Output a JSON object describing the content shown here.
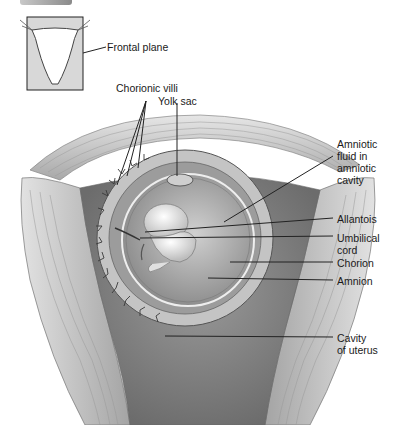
{
  "figure": {
    "type": "anatomical-illustration",
    "inset": {
      "label": "Frontal plane"
    },
    "labels": [
      {
        "id": "chorionic-villi",
        "text": "Chorionic villi"
      },
      {
        "id": "yolk-sac",
        "text": "Yolk sac"
      },
      {
        "id": "amniotic-fluid",
        "text": "Amniotic\nfluid in\namniotic\ncavity"
      },
      {
        "id": "allantois",
        "text": "Allantois"
      },
      {
        "id": "umbilical-cord",
        "text": "Umbilical\ncord"
      },
      {
        "id": "chorion",
        "text": "Chorion"
      },
      {
        "id": "amnion",
        "text": "Amnion"
      },
      {
        "id": "cavity-of-uterus",
        "text": "Cavity\nof uterus"
      }
    ]
  },
  "colors": {
    "background": "#ffffff",
    "label_text": "#1a1a1a",
    "leader_line": "#222222",
    "tissue_light": "#d6d6d6",
    "tissue_mid": "#a8a8a8",
    "tissue_dark": "#6e6e6e"
  }
}
